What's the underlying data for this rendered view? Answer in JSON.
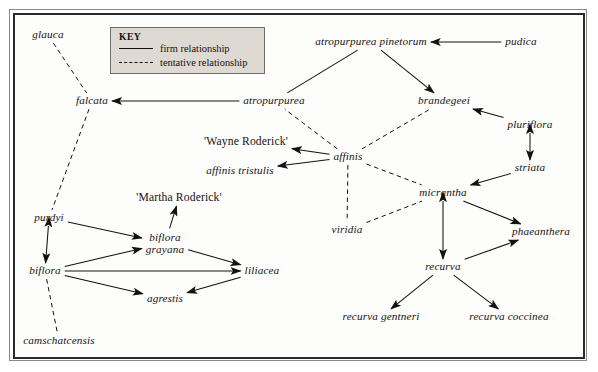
{
  "figure": {
    "type": "relationship-network-diagram"
  },
  "key": {
    "title": "KEY",
    "entries": [
      {
        "style": "solid",
        "label": "firm relationship"
      },
      {
        "style": "dashed",
        "label": "tentative relationship"
      }
    ]
  },
  "nodes": [
    {
      "id": "glauca",
      "label": "glauca",
      "x": 48,
      "y": 35,
      "lines": [
        "glauca"
      ]
    },
    {
      "id": "falcata",
      "label": "falcata",
      "x": 92,
      "y": 101,
      "lines": [
        "falcata"
      ]
    },
    {
      "id": "atropurpurea",
      "label": "atropurpurea",
      "x": 274,
      "y": 101,
      "lines": [
        "atropurpurea"
      ]
    },
    {
      "id": "atropurpurea-pinetorum",
      "label": "atropurpurea pinetorum",
      "x": 371,
      "y": 42,
      "lines": [
        "atropurpurea pinetorum"
      ]
    },
    {
      "id": "pudica",
      "label": "pudica",
      "x": 521,
      "y": 42,
      "lines": [
        "pudica"
      ]
    },
    {
      "id": "brandegeei",
      "label": "brandegeei",
      "x": 444,
      "y": 101,
      "lines": [
        "brandegeei"
      ]
    },
    {
      "id": "pluriflora",
      "label": "pluriflora",
      "x": 530,
      "y": 125,
      "lines": [
        "pluriflora"
      ]
    },
    {
      "id": "striata",
      "label": "striata",
      "x": 530,
      "y": 168,
      "lines": [
        "striata"
      ]
    },
    {
      "id": "wayne-roderick",
      "label": "'Wayne Roderick'",
      "x": 246,
      "y": 142,
      "lines": [
        "'Wayne Roderick'"
      ]
    },
    {
      "id": "affinis-tristulis",
      "label": "affinis tristulis",
      "x": 240,
      "y": 171,
      "lines": [
        "affinis tristulis"
      ]
    },
    {
      "id": "affinis",
      "label": "affinis",
      "x": 348,
      "y": 157,
      "lines": [
        "affinis"
      ]
    },
    {
      "id": "martha-roderick",
      "label": "'Martha Roderick'",
      "x": 179,
      "y": 198,
      "lines": [
        "'Martha Roderick'"
      ]
    },
    {
      "id": "micrantha",
      "label": "micrantha",
      "x": 443,
      "y": 193,
      "lines": [
        "micrantha"
      ]
    },
    {
      "id": "viridia",
      "label": "viridia",
      "x": 347,
      "y": 230,
      "lines": [
        "viridia"
      ]
    },
    {
      "id": "phaeanthera",
      "label": "phaeanthera",
      "x": 541,
      "y": 232,
      "lines": [
        "phaeanthera"
      ]
    },
    {
      "id": "purdyi",
      "label": "purdyi",
      "x": 49,
      "y": 218,
      "lines": [
        "purdyi"
      ]
    },
    {
      "id": "biflora-grayana",
      "label": "biflora grayana",
      "x": 165,
      "y": 243,
      "lines": [
        "biflora",
        "grayana"
      ]
    },
    {
      "id": "biflora",
      "label": "biflora",
      "x": 45,
      "y": 271,
      "lines": [
        "biflora"
      ]
    },
    {
      "id": "liliacea",
      "label": "liliacea",
      "x": 262,
      "y": 271,
      "lines": [
        "liliacea"
      ]
    },
    {
      "id": "agrestis",
      "label": "agrestis",
      "x": 165,
      "y": 299,
      "lines": [
        "agrestis"
      ]
    },
    {
      "id": "camschatcensis",
      "label": "camschatcensis",
      "x": 59,
      "y": 341,
      "lines": [
        "camschatcensis"
      ]
    },
    {
      "id": "recurva",
      "label": "recurva",
      "x": 443,
      "y": 267,
      "lines": [
        "recurva"
      ]
    },
    {
      "id": "recurva-gentneri",
      "label": "recurva gentneri",
      "x": 381,
      "y": 317,
      "lines": [
        "recurva gentneri"
      ]
    },
    {
      "id": "recurva-coccinea",
      "label": "recurva coccinea",
      "x": 509,
      "y": 317,
      "lines": [
        "recurva coccinea"
      ]
    }
  ],
  "edges": [
    {
      "from": "atropurpurea",
      "to": "falcata",
      "style": "solid",
      "arrow": "to"
    },
    {
      "from": "atropurpurea",
      "to": "atropurpurea-pinetorum",
      "style": "solid",
      "arrow": "none"
    },
    {
      "from": "atropurpurea-pinetorum",
      "to": "brandegeei",
      "style": "solid",
      "arrow": "to"
    },
    {
      "from": "pudica",
      "to": "atropurpurea-pinetorum",
      "style": "solid",
      "arrow": "to"
    },
    {
      "from": "pluriflora",
      "to": "brandegeei",
      "style": "solid",
      "arrow": "to"
    },
    {
      "from": "pluriflora",
      "to": "striata",
      "style": "solid",
      "arrow": "both"
    },
    {
      "from": "striata",
      "to": "micrantha",
      "style": "solid",
      "arrow": "to"
    },
    {
      "from": "affinis",
      "to": "wayne-roderick",
      "style": "solid",
      "arrow": "to"
    },
    {
      "from": "affinis",
      "to": "affinis-tristulis",
      "style": "solid",
      "arrow": "to"
    },
    {
      "from": "affinis",
      "to": "atropurpurea",
      "style": "dashed",
      "arrow": "none"
    },
    {
      "from": "affinis",
      "to": "brandegeei",
      "style": "dashed",
      "arrow": "none"
    },
    {
      "from": "affinis",
      "to": "micrantha",
      "style": "dashed",
      "arrow": "none"
    },
    {
      "from": "affinis",
      "to": "viridia",
      "style": "dashed",
      "arrow": "none"
    },
    {
      "from": "viridia",
      "to": "micrantha",
      "style": "dashed",
      "arrow": "none"
    },
    {
      "from": "glauca",
      "to": "falcata",
      "style": "dashed",
      "arrow": "none"
    },
    {
      "from": "falcata",
      "to": "purdyi",
      "style": "dashed",
      "arrow": "none"
    },
    {
      "from": "micrantha",
      "to": "recurva",
      "style": "solid",
      "arrow": "both"
    },
    {
      "from": "micrantha",
      "to": "phaeanthera",
      "style": "solid",
      "arrow": "to"
    },
    {
      "from": "recurva",
      "to": "phaeanthera",
      "style": "solid",
      "arrow": "to"
    },
    {
      "from": "recurva",
      "to": "recurva-gentneri",
      "style": "solid",
      "arrow": "to"
    },
    {
      "from": "recurva",
      "to": "recurva-coccinea",
      "style": "solid",
      "arrow": "to"
    },
    {
      "from": "purdyi",
      "to": "biflora",
      "style": "solid",
      "arrow": "both"
    },
    {
      "from": "purdyi",
      "to": "biflora-grayana",
      "style": "solid",
      "arrow": "to"
    },
    {
      "from": "biflora",
      "to": "biflora-grayana",
      "style": "solid",
      "arrow": "to"
    },
    {
      "from": "biflora",
      "to": "liliacea",
      "style": "solid",
      "arrow": "to"
    },
    {
      "from": "biflora",
      "to": "agrestis",
      "style": "solid",
      "arrow": "to"
    },
    {
      "from": "biflora-grayana",
      "to": "martha-roderick",
      "style": "solid",
      "arrow": "to"
    },
    {
      "from": "biflora-grayana",
      "to": "liliacea",
      "style": "solid",
      "arrow": "to"
    },
    {
      "from": "liliacea",
      "to": "agrestis",
      "style": "solid",
      "arrow": "to"
    },
    {
      "from": "biflora",
      "to": "camschatcensis",
      "style": "dashed",
      "arrow": "none"
    }
  ],
  "colors": {
    "line": "#14120f",
    "text": "#15130f",
    "key_fill": "#dedad3",
    "key_border": "#6f6c66",
    "frame_outer": "#8a8a86",
    "frame_inner": "#2b2b2b"
  }
}
